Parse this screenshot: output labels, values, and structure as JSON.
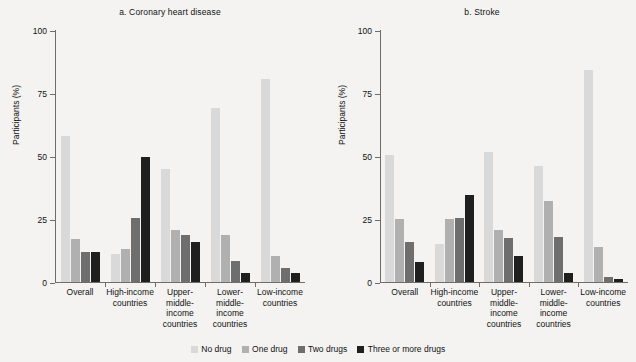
{
  "figure": {
    "y_axis_label": "Participants (%)"
  },
  "legend": {
    "items": [
      {
        "label": "No drug",
        "color": "#d9d9d9"
      },
      {
        "label": "One drug",
        "color": "#b0b0b0"
      },
      {
        "label": "Two drugs",
        "color": "#6e6e6e"
      },
      {
        "label": "Three or more drugs",
        "color": "#1f1f1f"
      }
    ]
  },
  "chart_data": [
    {
      "type": "bar",
      "title": "a. Coronary heart disease",
      "xlabel": "",
      "ylabel": "Participants (%)",
      "ylim": [
        0,
        100
      ],
      "yticks": [
        0,
        25,
        50,
        75,
        100
      ],
      "grid": false,
      "legend_position": "bottom",
      "categories": [
        "Overall",
        "High-income\ncountries",
        "Upper-\nmiddle-\nincome\ncountries",
        "Lower-\nmiddle-\nincome\ncountries",
        "Low-income\ncountries"
      ],
      "series": [
        {
          "name": "No drug",
          "values": [
            58,
            11,
            45,
            69,
            80.5
          ]
        },
        {
          "name": "One drug",
          "values": [
            17,
            13,
            20.5,
            18.5,
            10.5
          ]
        },
        {
          "name": "Two drugs",
          "values": [
            12,
            25.5,
            18.5,
            8.5,
            5.5
          ]
        },
        {
          "name": "Three or more drugs",
          "values": [
            12,
            49.5,
            16,
            3.5,
            3.5
          ]
        }
      ]
    },
    {
      "type": "bar",
      "title": "b. Stroke",
      "xlabel": "",
      "ylabel": "Participants (%)",
      "ylim": [
        0,
        100
      ],
      "yticks": [
        0,
        25,
        50,
        75,
        100
      ],
      "grid": false,
      "legend_position": "bottom",
      "categories": [
        "Overall",
        "High-income\ncountries",
        "Upper-\nmiddle-\nincome\ncountries",
        "Lower-\nmiddle-\nincome\ncountries",
        "Low-income\ncountries"
      ],
      "series": [
        {
          "name": "No drug",
          "values": [
            50.5,
            15,
            51.5,
            46,
            84
          ]
        },
        {
          "name": "One drug",
          "values": [
            25,
            25,
            20.5,
            32,
            14
          ]
        },
        {
          "name": "Two drugs",
          "values": [
            16,
            25.5,
            17.5,
            18,
            2
          ]
        },
        {
          "name": "Three or more drugs",
          "values": [
            8,
            34.5,
            10.5,
            3.5,
            1
          ]
        }
      ]
    }
  ]
}
